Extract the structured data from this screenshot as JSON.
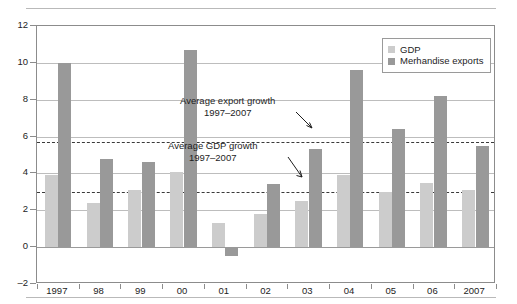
{
  "chart_data": {
    "type": "bar",
    "title": "",
    "subtitle": "",
    "xlabel": "",
    "ylabel": "",
    "ylim": [
      -2,
      12
    ],
    "yticks": [
      12,
      10,
      8,
      6,
      4,
      2,
      0,
      -2
    ],
    "ytick_labels": [
      "12",
      "10",
      "8",
      "6",
      "4",
      "2",
      "0",
      "–2"
    ],
    "grid": true,
    "legend_position": "top-right",
    "categories": [
      "1997",
      "98",
      "99",
      "00",
      "01",
      "02",
      "03",
      "04",
      "05",
      "06",
      "2007"
    ],
    "series": [
      {
        "name": "GDP",
        "color": "#cccccc",
        "values": [
          3.9,
          2.4,
          3.1,
          4.1,
          1.3,
          1.8,
          2.5,
          3.9,
          3.0,
          3.5,
          3.1
        ]
      },
      {
        "name": "Merhandise exports",
        "color": "#999999",
        "values": [
          10.0,
          4.8,
          4.6,
          10.7,
          -0.5,
          3.4,
          5.3,
          9.6,
          6.4,
          8.2,
          5.5
        ]
      }
    ],
    "reference_lines": [
      {
        "name": "average-export-growth",
        "value": 5.7,
        "style": "dashed",
        "label_line1": "Average export growth",
        "label_line2": "1997–2007"
      },
      {
        "name": "average-gdp-growth",
        "value": 3.0,
        "style": "dashed",
        "label_line1": "Average GDP growth",
        "label_line2": "1997–2007"
      }
    ]
  },
  "legend": {
    "items": [
      {
        "label": "GDP",
        "color": "#cccccc"
      },
      {
        "label": "Merhandise exports",
        "color": "#999999"
      }
    ]
  },
  "annotations": {
    "export_growth": {
      "line1": "Average export growth",
      "line2": "1997–2007"
    },
    "gdp_growth": {
      "line1": "Average GDP growth",
      "line2": "1997–2007"
    }
  }
}
